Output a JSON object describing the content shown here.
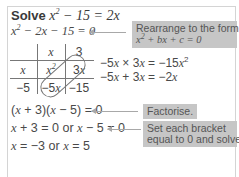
{
  "problem": {
    "title_word": "Solve",
    "title_equation": "x² − 15 = 2x"
  },
  "steps": [
    {
      "text": "x² − 2x − 15 = 0",
      "note": "Rearrange to the form x² + bx + c = 0"
    },
    {
      "text": "(x + 3)(x − 5) = 0",
      "note": "Factorise."
    },
    {
      "text": "x + 3 = 0 or x − 5 = 0",
      "note": "Set each bracket equal to 0 and solve."
    },
    {
      "text": "x = −3 or x = 5"
    }
  ],
  "grid": {
    "col_headers": [
      "x",
      "3"
    ],
    "row_headers": [
      "x",
      "−5"
    ],
    "cells": [
      [
        "x²",
        "3x"
      ],
      [
        "−5x",
        "−15"
      ]
    ]
  },
  "working": [
    "−5x × 3x = −15x²",
    "−5x + 3x = −2x"
  ],
  "notes": {
    "rearrange_line1": "Rearrange to the form",
    "rearrange_line2": "x² + bx + c = 0",
    "factorise": "Factorise.",
    "set_line1": "Set each bracket",
    "set_line2": "equal to 0 and solve."
  },
  "colors": {
    "note_bg": "#c6c6c6",
    "text": "#3a3a3a",
    "arrow": "#a8a8a8",
    "frame_border": "#d4d4d4"
  }
}
